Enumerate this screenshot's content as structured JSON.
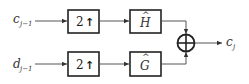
{
  "diagram": {
    "inputs": [
      {
        "name": "c",
        "subscript": "j−1"
      },
      {
        "name": "d",
        "subscript": "j−1"
      }
    ],
    "upsamplers": [
      {
        "label": "2",
        "symbol": "↑"
      },
      {
        "label": "2",
        "symbol": "↑"
      }
    ],
    "filters": [
      {
        "name": "H",
        "accent": "^"
      },
      {
        "name": "G",
        "accent": "^"
      }
    ],
    "summer": {
      "symbol": "⊕"
    },
    "output": {
      "name": "c",
      "subscript": "j"
    },
    "colors": {
      "stroke": "#222222",
      "line": "#555555",
      "background": "#ffffff"
    }
  }
}
